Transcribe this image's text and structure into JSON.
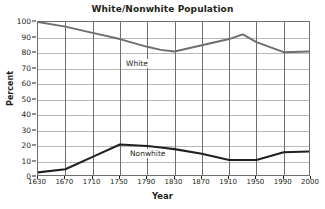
{
  "chart_data": {
    "type": "line",
    "title": "White/Nonwhite Population",
    "xlabel": "Year",
    "ylabel": "Percent",
    "x": [
      1630,
      1670,
      1710,
      1750,
      1790,
      1810,
      1830,
      1870,
      1910,
      1930,
      1950,
      1990,
      2000
    ],
    "xticks": [
      "1630",
      "1670",
      "1710",
      "1750",
      "1790",
      "1830",
      "1870",
      "1910",
      "1950",
      "1990",
      "2000"
    ],
    "yticks": [
      "100",
      "90",
      "80",
      "70",
      "60",
      "50",
      "40",
      "30",
      "20",
      "10",
      "0"
    ],
    "xlim": [
      1630,
      2000
    ],
    "ylim": [
      0,
      100
    ],
    "grid": true,
    "legend_position": "inline-labels",
    "series": [
      {
        "name": "White",
        "color": "#6d6e71",
        "values": [
          100,
          97,
          93,
          89,
          84,
          82,
          81,
          85,
          89,
          92,
          87,
          80.5,
          81
        ]
      },
      {
        "name": "Nonwhite",
        "color": "#231f20",
        "values": [
          3,
          5,
          13,
          21,
          20,
          19,
          18,
          15,
          11,
          11,
          11,
          16,
          16.5
        ]
      }
    ],
    "annotations": [
      {
        "text": "White",
        "x": 1755,
        "y": 86
      },
      {
        "text": "Nonwhite",
        "x": 1760,
        "y": 26
      }
    ]
  }
}
